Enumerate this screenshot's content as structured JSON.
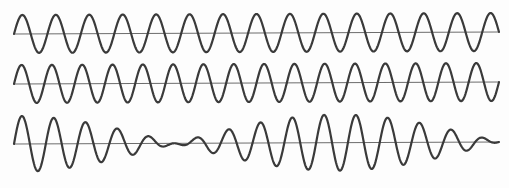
{
  "figure": {
    "background_color": "#fdfdfd",
    "width": 509,
    "height": 188,
    "stroke_color": "#3a3a3a",
    "axis_color": "#6d6d6d",
    "stroke_width": 2.2,
    "axis_width": 1.1
  },
  "chart_data": {
    "type": "line",
    "title": "",
    "subtitle": "",
    "xlabel": "",
    "ylabel": "",
    "grid": false,
    "legend": null,
    "x": {
      "min": 0,
      "max": 509,
      "unit": "px",
      "sample_step": 0.5
    },
    "panels": [
      {
        "name": "wave-1",
        "label": "Wave 1",
        "baseline_y": 33,
        "x_start": 14,
        "x_end": 499,
        "amplitude": 19,
        "cycles": 14.5,
        "wavelength": 33.45,
        "frequency_rel": 14.5,
        "phase_deg": 0,
        "ylim": [
          14,
          52
        ]
      },
      {
        "name": "wave-2",
        "label": "Wave 2",
        "baseline_y": 83,
        "x_start": 14,
        "x_end": 499,
        "amplitude": 19,
        "cycles": 16,
        "wavelength": 30.31,
        "frequency_rel": 16,
        "phase_deg": 0,
        "ylim": [
          64,
          102
        ]
      },
      {
        "name": "wave-sum",
        "label": "Resultant (wave 1 + wave 2)",
        "baseline_y": 143,
        "x_start": 14,
        "x_end": 499,
        "amplitude": 28,
        "component_amplitude": 14,
        "cycles_carrier": 15.25,
        "beat_count": 1.5,
        "envelope_nodes_x": [
          128,
          363
        ],
        "envelope_antinodes_x": [
          14,
          245,
          480
        ],
        "ylim": [
          113,
          175
        ]
      }
    ]
  }
}
